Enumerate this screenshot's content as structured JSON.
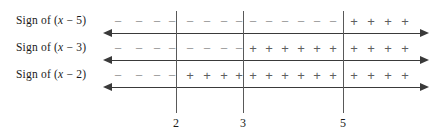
{
  "figure": {
    "type": "sign-chart",
    "background_color": "#ffffff",
    "axis_color": "#3a3a3a",
    "divider_color": "#595959",
    "plus_color": "#5f5f5f",
    "minus_color": "#a2a2a2",
    "text_color": "#1a1a1a"
  },
  "rows": [
    {
      "label_prefix": "Sign of (",
      "label_var": "x",
      "label_suffix": " − 5)",
      "label_full": "Sign of (x − 5)",
      "factor_root": 5,
      "signs": [
        "−",
        "−",
        "−",
        "−",
        "−",
        "−",
        "−",
        "−",
        "−",
        "−",
        "−",
        "−",
        "−",
        "−",
        "+",
        "+",
        "+",
        "+"
      ]
    },
    {
      "label_prefix": "Sign of (",
      "label_var": "x",
      "label_suffix": " − 3)",
      "label_full": "Sign of (x − 3)",
      "factor_root": 3,
      "signs": [
        "−",
        "−",
        "−",
        "−",
        "−",
        "−",
        "−",
        "−",
        "+",
        "+",
        "+",
        "+",
        "+",
        "+",
        "+",
        "+",
        "+",
        "+"
      ]
    },
    {
      "label_prefix": "Sign of (",
      "label_var": "x",
      "label_suffix": " − 2)",
      "label_full": "Sign of (x − 2)",
      "factor_root": 2,
      "signs": [
        "−",
        "−",
        "−",
        "−",
        "+",
        "+",
        "+",
        "+",
        "+",
        "+",
        "+",
        "+",
        "+",
        "+",
        "+",
        "+",
        "+",
        "+"
      ]
    }
  ],
  "ticks": [
    {
      "label": "2"
    },
    {
      "label": "3"
    },
    {
      "label": "5"
    }
  ]
}
